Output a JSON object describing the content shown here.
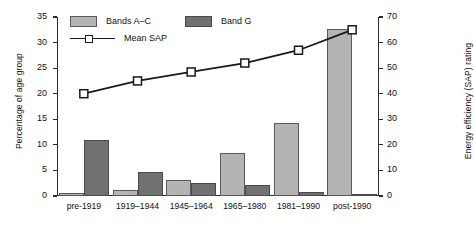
{
  "chart_data": {
    "type": "bar",
    "title": "",
    "xlabel": "",
    "ylabel": "Percentage of age group",
    "y2label": "Energy efficiency (SAP) rating",
    "categories": [
      "pre-1919",
      "1919–1944",
      "1945–1964",
      "1965–1980",
      "1981–1990",
      "post-1990"
    ],
    "ylim": [
      0,
      35
    ],
    "y2lim": [
      0,
      70
    ],
    "yticks": [
      0,
      5,
      10,
      15,
      20,
      25,
      30,
      35
    ],
    "y2ticks": [
      0,
      10,
      20,
      30,
      40,
      50,
      60,
      70
    ],
    "grid": false,
    "legend_position": "top-left",
    "series": [
      {
        "name": "Bands A–C",
        "type": "bar",
        "axis": "left",
        "color": "#b4b4b4",
        "values": [
          0.5,
          1.1,
          3.2,
          8.5,
          14.2,
          32.7
        ]
      },
      {
        "name": "Band G",
        "type": "bar",
        "axis": "left",
        "color": "#717171",
        "values": [
          11.0,
          4.7,
          2.5,
          2.2,
          0.7,
          0.3
        ]
      },
      {
        "name": "Mean SAP",
        "type": "line",
        "axis": "right",
        "color": "#1a1a1a",
        "marker": "square-open",
        "values": [
          40,
          45,
          48.5,
          52,
          57,
          65
        ]
      }
    ]
  },
  "legend": {
    "bands_ac_label": "Bands A–C",
    "band_g_label": "Band G",
    "mean_sap_label": "Mean SAP"
  },
  "axes": {
    "left_title": "Percentage of age group",
    "right_title": "Energy efficiency (SAP) rating"
  }
}
